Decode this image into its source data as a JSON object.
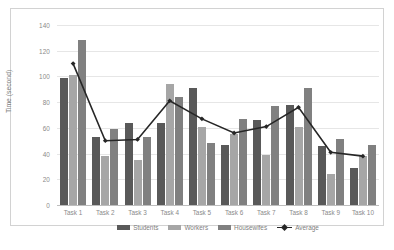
{
  "chart_data": {
    "type": "bar",
    "title": "",
    "xlabel": "",
    "ylabel": "Time (second)",
    "ylim": [
      0,
      140
    ],
    "yticks": [
      0,
      20,
      40,
      60,
      80,
      100,
      120,
      140
    ],
    "grid": true,
    "legend_position": "bottom",
    "categories": [
      "Task 1",
      "Task 2",
      "Task 3",
      "Task 4",
      "Task 5",
      "Task 6",
      "Task 7",
      "Task 8",
      "Task 9",
      "Task 10"
    ],
    "series": [
      {
        "name": "Students",
        "type": "bar",
        "color": "#595959",
        "values": [
          99,
          53,
          64,
          64,
          91,
          47,
          66,
          78,
          46,
          29
        ]
      },
      {
        "name": "Workers",
        "type": "bar",
        "color": "#a6a6a6",
        "values": [
          101,
          38,
          35,
          94,
          61,
          55,
          39,
          61,
          24,
          38
        ]
      },
      {
        "name": "Housewifes",
        "type": "bar",
        "color": "#808080",
        "values": [
          128,
          59,
          53,
          84,
          48,
          67,
          77,
          91,
          51,
          47
        ]
      },
      {
        "name": "Average",
        "type": "line",
        "color": "#262626",
        "values": [
          110,
          50,
          51,
          81,
          67,
          56,
          61,
          76,
          41,
          38
        ]
      }
    ]
  },
  "legend": {
    "items": [
      {
        "label": "Students",
        "marker": "bar-swatch-dark"
      },
      {
        "label": "Workers",
        "marker": "bar-swatch-light"
      },
      {
        "label": "Housewifes",
        "marker": "bar-swatch-mid"
      },
      {
        "label": "Average",
        "marker": "line-marker-diamond"
      }
    ]
  },
  "caption": {
    "text": ""
  }
}
